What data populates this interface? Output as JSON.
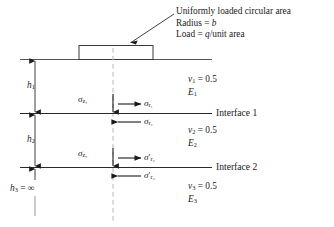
{
  "figure": {
    "type": "three-layer-elastic-system-under-circular-load",
    "background_color": "#ffffff",
    "line_color": "#1a1a1a",
    "centerline_color": "#c9b9bb"
  },
  "callout": {
    "line1": "Uniformly loaded circular area",
    "line2_prefix": "Radius = ",
    "line2_symbol": "b",
    "line3_prefix": "Load = ",
    "line3_symbol": "q",
    "line3_suffix": "/unit area"
  },
  "interfaces": [
    {
      "label": "Interface 1",
      "y": 113
    },
    {
      "label": "Interface 2",
      "y": 167
    }
  ],
  "layers": [
    {
      "index": "1",
      "poisson_symbol": "v",
      "poisson_sub": "1",
      "poisson_value": "= 0.5",
      "modulus_symbol": "E",
      "modulus_sub": "1",
      "thickness_symbol": "h",
      "thickness_sub": "1",
      "thickness_value": ""
    },
    {
      "index": "2",
      "poisson_symbol": "v",
      "poisson_sub": "2",
      "poisson_value": "= 0.5",
      "modulus_symbol": "E",
      "modulus_sub": "2",
      "thickness_symbol": "h",
      "thickness_sub": "2",
      "thickness_value": ""
    },
    {
      "index": "3",
      "poisson_symbol": "v",
      "poisson_sub": "3",
      "poisson_value": "= 0.5",
      "modulus_symbol": "E",
      "modulus_sub": "3",
      "thickness_symbol": "h",
      "thickness_sub": "3",
      "thickness_value": "= ∞"
    }
  ],
  "stresses": [
    {
      "name": "sigma-z1",
      "symbol": "σ",
      "sub": "z₁",
      "prime": "",
      "direction": "down"
    },
    {
      "name": "sigma-r1",
      "symbol": "σ",
      "sub": "r₁",
      "prime": "",
      "direction": "right"
    },
    {
      "name": "sigma-r2",
      "symbol": "σ",
      "sub": "r₂",
      "prime": "",
      "direction": "left"
    },
    {
      "name": "sigma-z2",
      "symbol": "σ",
      "sub": "z₂",
      "prime": "",
      "direction": "down"
    },
    {
      "name": "sigma-r2-prime",
      "symbol": "σ",
      "sub": "r₂",
      "prime": "′",
      "direction": "right"
    },
    {
      "name": "sigma-r3-prime",
      "symbol": "σ",
      "sub": "r₃",
      "prime": "′",
      "direction": "left"
    }
  ]
}
